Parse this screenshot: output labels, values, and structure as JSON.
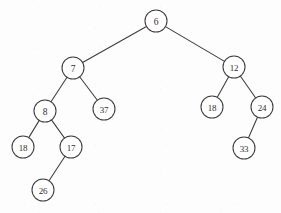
{
  "figure": {
    "name": "binary-tree-diagram",
    "width": 281,
    "height": 213,
    "background_color": "#fdfdfd",
    "stroke_color": "#3c3c3c",
    "node_fill_color": "#ffffff",
    "label_color": "#2e2e2e",
    "node_radius": 11
  },
  "chart_data": {
    "type": "diagram",
    "diagram_kind": "binary-tree",
    "title": "",
    "node_count": 11,
    "edge_count": 10,
    "root": "n6",
    "nodes": [
      {
        "id": "n6",
        "label": "6",
        "x": 156,
        "y": 21,
        "r": 11,
        "depth": 0
      },
      {
        "id": "n7",
        "label": "7",
        "x": 73,
        "y": 68,
        "r": 11,
        "depth": 1
      },
      {
        "id": "n12",
        "label": "12",
        "x": 234,
        "y": 67,
        "r": 11,
        "depth": 1
      },
      {
        "id": "n8",
        "label": "8",
        "x": 45,
        "y": 111,
        "r": 11,
        "depth": 2
      },
      {
        "id": "n37",
        "label": "37",
        "x": 104,
        "y": 109,
        "r": 11,
        "depth": 2
      },
      {
        "id": "n18L",
        "label": "18",
        "x": 212,
        "y": 107,
        "r": 11,
        "depth": 2
      },
      {
        "id": "n24",
        "label": "24",
        "x": 262,
        "y": 107,
        "r": 11,
        "depth": 2
      },
      {
        "id": "n18A",
        "label": "18",
        "x": 23,
        "y": 147,
        "r": 11,
        "depth": 3
      },
      {
        "id": "n17",
        "label": "17",
        "x": 71,
        "y": 147,
        "r": 11,
        "depth": 3
      },
      {
        "id": "n33",
        "label": "33",
        "x": 244,
        "y": 148,
        "r": 11,
        "depth": 3
      },
      {
        "id": "n26",
        "label": "26",
        "x": 43,
        "y": 190,
        "r": 11,
        "depth": 4
      }
    ],
    "edges": [
      {
        "from": "n6",
        "to": "n7",
        "side": "left"
      },
      {
        "from": "n6",
        "to": "n12",
        "side": "right"
      },
      {
        "from": "n7",
        "to": "n8",
        "side": "left"
      },
      {
        "from": "n7",
        "to": "n37",
        "side": "right"
      },
      {
        "from": "n8",
        "to": "n18A",
        "side": "left"
      },
      {
        "from": "n8",
        "to": "n17",
        "side": "right"
      },
      {
        "from": "n17",
        "to": "n26",
        "side": "left"
      },
      {
        "from": "n12",
        "to": "n18L",
        "side": "left"
      },
      {
        "from": "n12",
        "to": "n24",
        "side": "right"
      },
      {
        "from": "n24",
        "to": "n33",
        "side": "left"
      }
    ]
  }
}
